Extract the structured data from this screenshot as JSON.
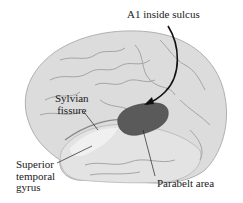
{
  "figure": {
    "colors": {
      "background": "#ffffff",
      "brain_fill": "#dcdcdc",
      "brain_shadow": "#b5b5b5",
      "gyri_lines": "#9a9a9a",
      "a1_region": "#5a5a5a",
      "temporal_highlight": "#ececec",
      "leader_lines": "#1a1a1a"
    }
  },
  "labels": {
    "a1": "A1 inside sulcus",
    "sylvian_line1": "Sylvian",
    "sylvian_line2": "fissure",
    "stg_line1": "Superior",
    "stg_line2": "temporal",
    "stg_line3": "gyrus",
    "parabelt": "Parabelt area"
  }
}
